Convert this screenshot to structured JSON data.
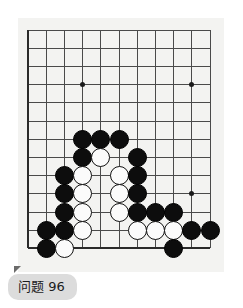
{
  "app": {
    "title": "Go Problem Diagram",
    "background_color": "#ffffff"
  },
  "board": {
    "name": "go-board",
    "board_color": "#f3f3f1",
    "line_color": "#4a4a4a",
    "edge_color": "#2a2a2a",
    "black_color": "#0d0d0d",
    "white_color": "#fbfbfb",
    "columns": 11,
    "rows": 13,
    "cell_size": 18.2,
    "origin_x": 10,
    "origin_y": 12,
    "stone_radius": 9.5,
    "hoshi": [
      {
        "col": 3,
        "row": 3
      },
      {
        "col": 9,
        "row": 3
      },
      {
        "col": 9,
        "row": 9
      }
    ],
    "stones": [
      {
        "col": 3,
        "row": 6,
        "color": "black"
      },
      {
        "col": 4,
        "row": 6,
        "color": "black"
      },
      {
        "col": 5,
        "row": 6,
        "color": "black"
      },
      {
        "col": 3,
        "row": 7,
        "color": "black"
      },
      {
        "col": 4,
        "row": 7,
        "color": "white"
      },
      {
        "col": 6,
        "row": 7,
        "color": "black"
      },
      {
        "col": 2,
        "row": 8,
        "color": "black"
      },
      {
        "col": 3,
        "row": 8,
        "color": "white"
      },
      {
        "col": 5,
        "row": 8,
        "color": "white"
      },
      {
        "col": 6,
        "row": 8,
        "color": "black"
      },
      {
        "col": 2,
        "row": 9,
        "color": "black"
      },
      {
        "col": 3,
        "row": 9,
        "color": "white"
      },
      {
        "col": 5,
        "row": 9,
        "color": "white"
      },
      {
        "col": 6,
        "row": 9,
        "color": "black"
      },
      {
        "col": 2,
        "row": 10,
        "color": "black"
      },
      {
        "col": 3,
        "row": 10,
        "color": "white"
      },
      {
        "col": 5,
        "row": 10,
        "color": "white"
      },
      {
        "col": 6,
        "row": 10,
        "color": "black"
      },
      {
        "col": 7,
        "row": 10,
        "color": "black"
      },
      {
        "col": 8,
        "row": 10,
        "color": "black"
      },
      {
        "col": 1,
        "row": 11,
        "color": "black"
      },
      {
        "col": 2,
        "row": 11,
        "color": "black"
      },
      {
        "col": 3,
        "row": 11,
        "color": "white"
      },
      {
        "col": 6,
        "row": 11,
        "color": "white"
      },
      {
        "col": 7,
        "row": 11,
        "color": "white"
      },
      {
        "col": 8,
        "row": 11,
        "color": "white"
      },
      {
        "col": 9,
        "row": 11,
        "color": "black"
      },
      {
        "col": 10,
        "row": 11,
        "color": "black"
      },
      {
        "col": 1,
        "row": 12,
        "color": "black"
      },
      {
        "col": 2,
        "row": 12,
        "color": "white"
      },
      {
        "col": 8,
        "row": 12,
        "color": "black"
      }
    ]
  },
  "caption": {
    "label": "问题 96",
    "pill_color": "#dcdcdc",
    "text_color": "#1b1b1b"
  }
}
